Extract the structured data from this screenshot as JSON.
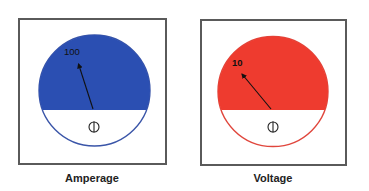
{
  "meters": [
    {
      "id": "amperage",
      "caption": "Amperage",
      "scale_label": "100",
      "fill_color": "#2b4fb2",
      "outline_color": "#3a55a8",
      "needle_icon": "meter-needle",
      "zero_adjust_icon": "zero-adjust-screw"
    },
    {
      "id": "voltage",
      "caption": "Voltage",
      "scale_label": "10",
      "fill_color": "#ee3b2f",
      "outline_color": "#e0463c",
      "needle_icon": "meter-needle",
      "zero_adjust_icon": "zero-adjust-screw"
    }
  ],
  "colors": {
    "frame": "#5a5a5a",
    "needle": "#111111",
    "background": "#ffffff"
  }
}
